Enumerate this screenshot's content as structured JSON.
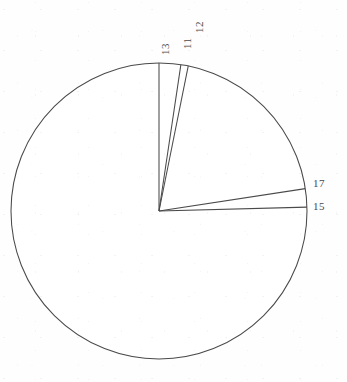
{
  "chart_data": {
    "type": "pie",
    "title": "",
    "subtitle": "",
    "xlabel": "",
    "ylabel": "",
    "legend_position": "none",
    "grid": false,
    "labels_rendered_on_slice_boundaries": true,
    "center": {
      "x": 159,
      "y": 211
    },
    "radius": 148,
    "start_angle_deg": 90,
    "direction": "clockwise",
    "stroke_color": "#4a4a4a",
    "fill_color": "#ffffff",
    "slices": [
      {
        "label": "13",
        "boundary_angle_deg": 90.0,
        "label_orientation": "rotated-90-ccw",
        "label_x": 160,
        "label_y": 55,
        "value": 0.0,
        "share_pct": 0.0
      },
      {
        "label": "11",
        "boundary_angle_deg": 81.5,
        "label_orientation": "rotated-90-ccw",
        "label_x": 182,
        "label_y": 49,
        "value": 8.5,
        "share_pct": 2.36
      },
      {
        "label": "12",
        "boundary_angle_deg": 78.6,
        "label_orientation": "rotated-90-ccw",
        "label_x": 194,
        "label_y": 33,
        "value": 2.9,
        "share_pct": 0.81
      },
      {
        "label": "17",
        "boundary_angle_deg": 8.7,
        "label_orientation": "horizontal",
        "label_x": 313,
        "label_y": 178,
        "value": 69.9,
        "share_pct": 19.42
      },
      {
        "label": "15",
        "boundary_angle_deg": 1.5,
        "label_orientation": "horizontal",
        "label_x": 313,
        "label_y": 201,
        "value": 7.2,
        "share_pct": 2.0
      },
      {
        "label": "",
        "boundary_angle_deg": 90.0,
        "label_orientation": "none",
        "label_x": null,
        "label_y": null,
        "value": 271.5,
        "share_pct": 75.42
      }
    ],
    "annotations": [
      {
        "text": "13",
        "x": 160,
        "y": 55,
        "rotation_deg": -90
      },
      {
        "text": "11",
        "x": 182,
        "y": 49,
        "rotation_deg": -90
      },
      {
        "text": "12",
        "x": 194,
        "y": 33,
        "rotation_deg": -90
      },
      {
        "text": "17",
        "x": 313,
        "y": 178,
        "rotation_deg": 0
      },
      {
        "text": "15",
        "x": 313,
        "y": 201,
        "rotation_deg": 0
      }
    ]
  },
  "figure": {
    "background_color": "#fefefe",
    "line_color": "#4a4a4a"
  }
}
